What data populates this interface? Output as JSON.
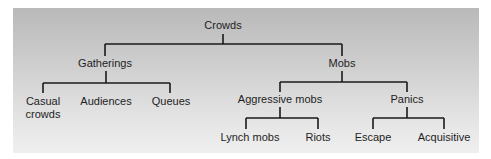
{
  "diagram": {
    "type": "tree",
    "root": {
      "label": "Crowds",
      "children": [
        {
          "label": "Gatherings",
          "children": [
            {
              "label": "Casual crowds",
              "line1": "Casual",
              "line2": "crowds"
            },
            {
              "label": "Audiences"
            },
            {
              "label": "Queues"
            }
          ]
        },
        {
          "label": "Mobs",
          "children": [
            {
              "label": "Aggressive mobs",
              "children": [
                {
                  "label": "Lynch mobs"
                },
                {
                  "label": "Riots"
                }
              ]
            },
            {
              "label": "Panics",
              "children": [
                {
                  "label": "Escape"
                },
                {
                  "label": "Acquisitive"
                }
              ]
            }
          ]
        }
      ]
    },
    "colors": {
      "line": "#1a1a1a",
      "text": "#1e1e1e",
      "panel_top": "#b9b9b9",
      "panel_bottom": "#efefef"
    }
  }
}
